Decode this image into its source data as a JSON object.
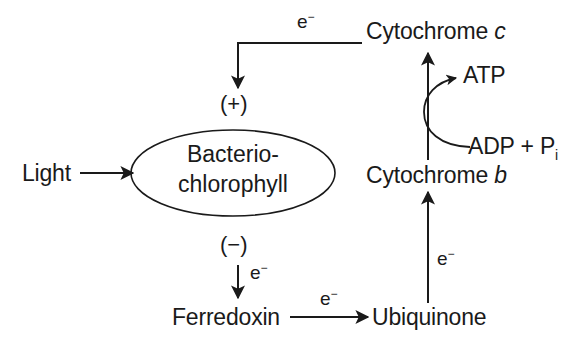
{
  "diagram": {
    "background_color": "#ffffff",
    "stroke_color": "#1a1a1a",
    "text_color": "#1a1a1a",
    "nodes": {
      "light": {
        "label": "Light"
      },
      "bacteriochlorophyll": {
        "line1": "Bacterio-",
        "line2": "chlorophyll",
        "shape": "ellipse"
      },
      "plus_sign": {
        "label": "(+)"
      },
      "minus_sign": {
        "label": "(−)"
      },
      "cytochrome_c": {
        "name": "Cytochrome",
        "italic": "c"
      },
      "cytochrome_b": {
        "name": "Cytochrome",
        "italic": "b"
      },
      "atp": {
        "label": "ATP"
      },
      "adp_pi": {
        "prefix": "ADP + P",
        "subscript": "i"
      },
      "ferredoxin": {
        "label": "Ferredoxin"
      },
      "ubiquinone": {
        "label": "Ubiquinone"
      }
    },
    "edge_labels": {
      "electron_top": {
        "symbol": "e",
        "charge": "−"
      },
      "electron_to_ferredoxin": {
        "symbol": "e",
        "charge": "−"
      },
      "electron_ferredoxin_to_ubiquinone": {
        "symbol": "e",
        "charge": "−"
      },
      "electron_ubiquinone_to_cytb": {
        "symbol": "e",
        "charge": "−"
      }
    },
    "edges": [
      {
        "name": "light-to-bacteriochlorophyll",
        "from": "light",
        "to": "bacteriochlorophyll",
        "style": "straight-arrow"
      },
      {
        "name": "cytochrome-c-to-plus",
        "from": "cytochrome_c",
        "to": "plus_sign",
        "style": "elbow-arrow",
        "label": "e−"
      },
      {
        "name": "minus-to-ferredoxin",
        "from": "minus_sign",
        "to": "ferredoxin",
        "style": "straight-arrow",
        "label": "e−"
      },
      {
        "name": "ferredoxin-to-ubiquinone",
        "from": "ferredoxin",
        "to": "ubiquinone",
        "style": "straight-arrow",
        "label": "e−"
      },
      {
        "name": "ubiquinone-to-cytochrome-b",
        "from": "ubiquinone",
        "to": "cytochrome_b",
        "style": "straight-arrow",
        "label": "e−"
      },
      {
        "name": "cytochrome-b-to-cytochrome-c",
        "from": "cytochrome_b",
        "to": "cytochrome_c",
        "style": "straight-arrow"
      },
      {
        "name": "adp-pi-to-atp",
        "from": "adp_pi",
        "to": "atp",
        "style": "curved-arrow"
      }
    ]
  }
}
